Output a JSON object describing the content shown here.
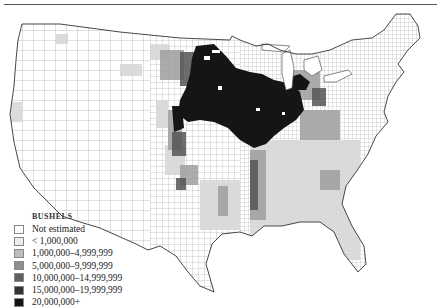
{
  "figure": {
    "type": "choropleth-map",
    "region": "Contiguous United States (county level)"
  },
  "legend": {
    "title": "BUSHELS",
    "items": [
      {
        "label": "Not estimated",
        "color": "#ffffff"
      },
      {
        "label": "< 1,000,000",
        "color": "#ececec"
      },
      {
        "label": "1,000,000–4,999,999",
        "color": "#bdbdbd"
      },
      {
        "label": "5,000,000–9,999,999",
        "color": "#8f8f8f"
      },
      {
        "label": "10,000,000–14,999,999",
        "color": "#606060"
      },
      {
        "label": "15,000,000–19,999,999",
        "color": "#333333"
      },
      {
        "label": "20,000,000+",
        "color": "#141414"
      }
    ]
  }
}
